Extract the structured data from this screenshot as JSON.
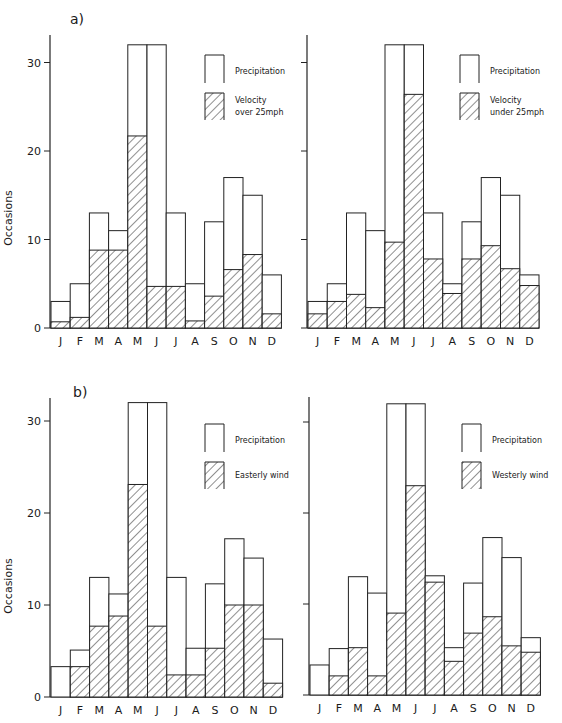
{
  "figure": {
    "panels": [
      {
        "label": "a)",
        "ylabel": "Occasions"
      },
      {
        "label": "b)",
        "ylabel": "Occasions"
      }
    ],
    "months": [
      "J",
      "F",
      "M",
      "A",
      "M",
      "J",
      "J",
      "A",
      "S",
      "O",
      "N",
      "D"
    ],
    "yticks": [
      "0",
      "10",
      "20",
      "30"
    ]
  },
  "chart_data": [
    {
      "type": "bar",
      "panel": "a) left",
      "title": "",
      "xlabel": "",
      "ylabel": "Occasions",
      "ylim": [
        0,
        33
      ],
      "yticks": [
        0,
        10,
        20,
        30
      ],
      "grid": false,
      "legend_position": "top-right",
      "categories": [
        "J",
        "F",
        "M",
        "A",
        "M",
        "J",
        "J",
        "A",
        "S",
        "O",
        "N",
        "D"
      ],
      "series": [
        {
          "name": "Precipitation",
          "style": "open",
          "values": [
            3,
            5,
            13,
            11,
            32,
            32,
            13,
            5,
            12,
            17,
            15,
            6
          ]
        },
        {
          "name": "Velocity over 25mph",
          "style": "hatched",
          "values": [
            0.7,
            1.2,
            8.8,
            8.8,
            21.7,
            4.7,
            4.7,
            0.8,
            3.6,
            6.6,
            8.3,
            1.6
          ]
        }
      ]
    },
    {
      "type": "bar",
      "panel": "a) right",
      "title": "",
      "xlabel": "",
      "ylabel": "",
      "ylim": [
        0,
        33
      ],
      "yticks": [
        0,
        10,
        20,
        30
      ],
      "grid": false,
      "legend_position": "top-right",
      "categories": [
        "J",
        "F",
        "M",
        "A",
        "M",
        "J",
        "J",
        "A",
        "S",
        "O",
        "N",
        "D"
      ],
      "series": [
        {
          "name": "Precipitation",
          "style": "open",
          "values": [
            3,
            5,
            13,
            11,
            32,
            32,
            13,
            5,
            12,
            17,
            15,
            6
          ]
        },
        {
          "name": "Velocity under 25mph",
          "style": "hatched",
          "values": [
            1.6,
            3,
            3.8,
            2.3,
            9.7,
            26.4,
            7.8,
            3.9,
            7.8,
            9.3,
            6.7,
            4.8
          ]
        }
      ]
    },
    {
      "type": "bar",
      "panel": "b) left",
      "title": "",
      "xlabel": "",
      "ylabel": "Occasions",
      "ylim": [
        0,
        33
      ],
      "yticks": [
        0,
        10,
        20,
        30
      ],
      "grid": false,
      "legend_position": "top-right",
      "categories": [
        "J",
        "F",
        "M",
        "A",
        "M",
        "J",
        "J",
        "A",
        "S",
        "O",
        "N",
        "D"
      ],
      "series": [
        {
          "name": "Precipitation",
          "style": "open",
          "values": [
            3.3,
            5.1,
            13,
            11.2,
            32,
            32,
            13,
            5.3,
            12.3,
            17.2,
            15.1,
            6.3
          ]
        },
        {
          "name": "Easterly wind",
          "style": "hatched",
          "values": [
            0,
            3.3,
            7.7,
            8.8,
            23.1,
            7.7,
            2.4,
            2.4,
            5.3,
            10,
            10,
            1.5
          ]
        }
      ]
    },
    {
      "type": "bar",
      "panel": "b) right",
      "title": "",
      "xlabel": "",
      "ylabel": "",
      "ylim": [
        0,
        33
      ],
      "yticks": [
        0,
        10,
        20,
        30
      ],
      "grid": false,
      "legend_position": "top-right",
      "categories": [
        "J",
        "F",
        "M",
        "A",
        "M",
        "J",
        "J",
        "A",
        "S",
        "O",
        "N",
        "D"
      ],
      "series": [
        {
          "name": "Precipitation",
          "style": "open",
          "values": [
            3.3,
            5.1,
            13,
            11.2,
            32,
            32,
            13.1,
            5.2,
            12.3,
            17.3,
            15.1,
            6.3
          ]
        },
        {
          "name": "Westerly wind",
          "style": "hatched",
          "values": [
            0,
            2.1,
            5.2,
            2.1,
            9.0,
            23.0,
            12.4,
            3.7,
            6.8,
            8.6,
            5.4,
            4.7
          ]
        }
      ]
    }
  ]
}
